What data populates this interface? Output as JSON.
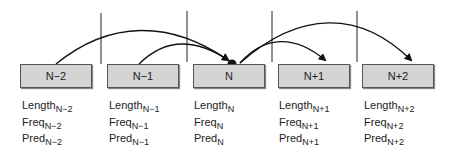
{
  "nodes": [
    {
      "label": "N−2",
      "length": "Length",
      "length_sub": "N−2",
      "freq": "Freq",
      "freq_sub": "N−2",
      "pred": "Pred",
      "pred_sub": "N−2",
      "more": "..."
    },
    {
      "label": "N−1",
      "length": "Length",
      "length_sub": "N−1",
      "freq": "Freq",
      "freq_sub": "N−1",
      "pred": "Pred",
      "pred_sub": "N−1",
      "more": "..."
    },
    {
      "label": "N",
      "length": "Length",
      "length_sub": "N",
      "freq": "Freq",
      "freq_sub": "N",
      "pred": "Pred",
      "pred_sub": "N",
      "more": "..."
    },
    {
      "label": "N+1",
      "length": "Length",
      "length_sub": "N+1",
      "freq": "Freq",
      "freq_sub": "N+1",
      "pred": "Pred",
      "pred_sub": "N+1",
      "more": "..."
    },
    {
      "label": "N+2",
      "length": "Length",
      "length_sub": "N+2",
      "freq": "Freq",
      "freq_sub": "N+2",
      "pred": "Pred",
      "pred_sub": "N+2",
      "more": "..."
    }
  ],
  "colors": {
    "box_fill": "#d4d4d4",
    "box_border": "#555555",
    "line": "#111111"
  }
}
